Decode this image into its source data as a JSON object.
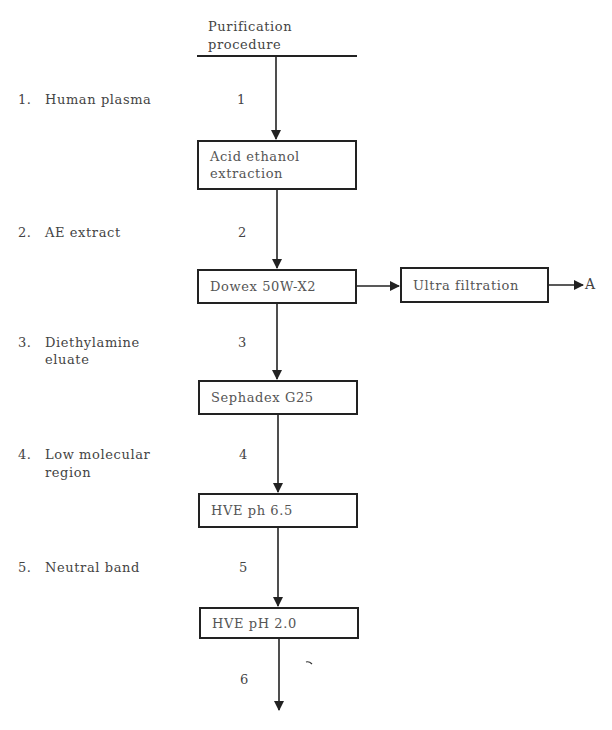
{
  "header": {
    "line1": "Purification",
    "line2": "procedure"
  },
  "stages": [
    {
      "num": "1.",
      "line1": "Human plasma",
      "line2": "",
      "flow_label": "1"
    },
    {
      "num": "2.",
      "line1": "AE extract",
      "line2": "",
      "flow_label": "2"
    },
    {
      "num": "3.",
      "line1": "Diethylamine",
      "line2": "eluate",
      "flow_label": "3"
    },
    {
      "num": "4.",
      "line1": "Low molecular",
      "line2": "region",
      "flow_label": "4"
    },
    {
      "num": "5.",
      "line1": "Neutral band",
      "line2": "",
      "flow_label": "5"
    },
    {
      "num": "",
      "line1": "",
      "line2": "",
      "flow_label": "6"
    }
  ],
  "steps": [
    {
      "line1": "Acid ethanol",
      "line2": "extraction"
    },
    {
      "line1": "Dowex 50W-X2",
      "line2": ""
    },
    {
      "line1": "Sephadex G25",
      "line2": ""
    },
    {
      "line1": "HVE ph 6.5",
      "line2": ""
    },
    {
      "line1": "HVE pH 2.0",
      "line2": ""
    }
  ],
  "side_branch": {
    "step": "Ultra filtration",
    "output_label": "A"
  },
  "colors": {
    "line": "#222222",
    "text": "#444444"
  }
}
